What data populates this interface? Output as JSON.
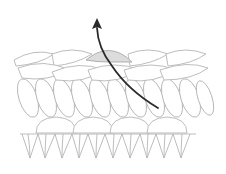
{
  "diagram": {
    "colors": {
      "background": "#ffffff",
      "yarn_outline": "#b5b5b5",
      "yarn_fill": "#ffffff",
      "highlight_loop_fill": "#dcdcdc",
      "arrow": "#2b2b2b"
    },
    "rows": [
      {
        "name": "top-chain-braid",
        "y_range": [
          50,
          80
        ]
      },
      {
        "name": "row-1-stitches",
        "y_range": [
          80,
          118
        ]
      },
      {
        "name": "row-2-bumps",
        "y_range": [
          114,
          134
        ]
      },
      {
        "name": "row-3-v-stitches",
        "y_range": [
          132,
          160
        ]
      }
    ],
    "arrow": {
      "direction": "up",
      "start": [
        158,
        108
      ],
      "end": [
        97,
        22
      ]
    }
  }
}
